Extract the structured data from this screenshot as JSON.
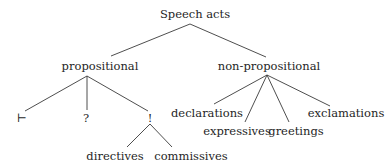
{
  "diagram": {
    "type": "tree",
    "root": {
      "label": "Speech acts"
    },
    "nodes": {
      "propositional": "propositional",
      "non_propositional": "non-propositional",
      "assert": "⊢",
      "question": "?",
      "command": "!",
      "directives": "directives",
      "commissives": "commissives",
      "declarations": "declarations",
      "expressives": "expressives",
      "greetings": "greetings",
      "exclamations": "exclamations"
    },
    "edges": [
      [
        "Speech acts",
        "propositional"
      ],
      [
        "Speech acts",
        "non-propositional"
      ],
      [
        "propositional",
        "⊢"
      ],
      [
        "propositional",
        "?"
      ],
      [
        "propositional",
        "!"
      ],
      [
        "!",
        "directives"
      ],
      [
        "!",
        "commissives"
      ],
      [
        "non-propositional",
        "declarations"
      ],
      [
        "non-propositional",
        "expressives"
      ],
      [
        "non-propositional",
        "greetings"
      ],
      [
        "non-propositional",
        "exclamations"
      ]
    ]
  }
}
